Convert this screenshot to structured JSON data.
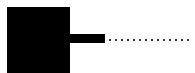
{
  "shapes": {
    "block": {
      "color": "#000000"
    },
    "bar": {
      "color": "#000000"
    },
    "dotted_line": {
      "color": "#333333",
      "dot_count": 14
    }
  }
}
